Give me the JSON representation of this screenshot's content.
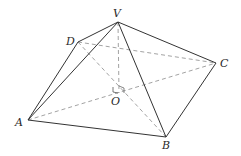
{
  "diagram": {
    "type": "right-rectangular-pyramid",
    "colors": {
      "solid_edge": "#333333",
      "hidden_edge": "#8a8a8a",
      "background": "#ffffff"
    },
    "vertices": {
      "V": {
        "label": "V",
        "x": 118,
        "y": 22
      },
      "D": {
        "label": "D",
        "x": 78,
        "y": 42
      },
      "C": {
        "label": "C",
        "x": 216,
        "y": 63
      },
      "A": {
        "label": "A",
        "x": 28,
        "y": 120
      },
      "B": {
        "label": "B",
        "x": 166,
        "y": 137
      },
      "O": {
        "label": "O",
        "x": 119,
        "y": 93
      }
    },
    "visible_edges": [
      "VA",
      "VB",
      "VC",
      "VD",
      "AB",
      "BC",
      "DA"
    ],
    "hidden_edges": [
      "DC",
      "AC",
      "DB",
      "VO"
    ],
    "right_angle_at": "O"
  }
}
